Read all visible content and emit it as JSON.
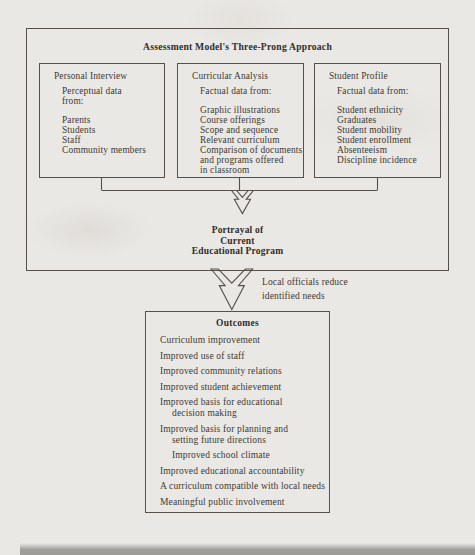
{
  "palette": {
    "page_bg": "#eae8e4",
    "line": "#56504a",
    "text": "#3e3832",
    "heading": "#322c26"
  },
  "header": {
    "title": "Assessment Model's Three-Prong Approach"
  },
  "prongs": [
    {
      "title": "Personal Interview",
      "intro": [
        "Perceptual data",
        "from:"
      ],
      "items": [
        "Parents",
        "Students",
        "Staff",
        "Community members"
      ]
    },
    {
      "title": "Curricular Analysis",
      "intro": [
        "Factual data from:"
      ],
      "items": [
        "Graphic illustrations",
        "Course offerings",
        "Scope and sequence",
        "Relevant curriculum",
        "Comparison of documents",
        "and programs offered",
        "in classroom"
      ]
    },
    {
      "title": "Student Profile",
      "intro": [
        "Factual data from:"
      ],
      "items": [
        "Student ethnicity",
        "Graduates",
        "Student mobility",
        "Student enrollment",
        "Absenteeism",
        "Discipline incidence"
      ]
    }
  ],
  "portrayal": {
    "lines": [
      "Portrayal of",
      "Current",
      "Educational Program"
    ]
  },
  "transition": {
    "lines": [
      "Local officials reduce",
      "identified needs"
    ]
  },
  "outcomes": {
    "title": "Outcomes",
    "lines": [
      "Curriculum improvement",
      "Improved use of staff",
      "Improved community relations",
      "Improved student achievement",
      "Improved basis for educational",
      "decision making",
      "Improved basis for planning and",
      "setting future directions",
      "Improved school climate",
      "Improved educational accountability",
      "A curriculum compatible with local needs",
      "Meaningful public involvement"
    ]
  }
}
